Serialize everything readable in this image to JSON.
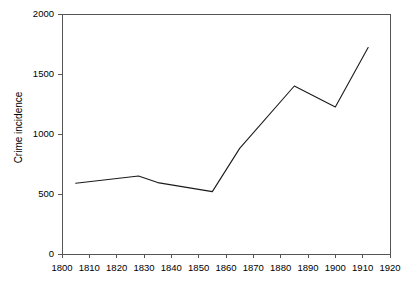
{
  "chart_data": {
    "type": "line",
    "title": "",
    "xlabel": "",
    "ylabel": "Crime incidence",
    "xlim": [
      1800,
      1920
    ],
    "ylim": [
      0,
      2000
    ],
    "xticks": [
      1800,
      1810,
      1820,
      1830,
      1840,
      1850,
      1860,
      1870,
      1880,
      1890,
      1900,
      1910,
      1920
    ],
    "yticks": [
      0,
      500,
      1000,
      1500,
      2000
    ],
    "xtick_labels": [
      "1800",
      "1810",
      "1820",
      "1830",
      "1840",
      "1850",
      "1860",
      "1870",
      "1880",
      "1890",
      "1900",
      "1910",
      "1920"
    ],
    "ytick_labels": [
      "0",
      "500",
      "1000",
      "1500",
      "2000"
    ],
    "grid": false,
    "legend": null,
    "series": [
      {
        "name": "Crime incidence",
        "color": "#1a1a1a",
        "x": [
          1805,
          1828,
          1835,
          1855,
          1865,
          1885,
          1900,
          1912
        ],
        "values": [
          590,
          650,
          595,
          520,
          880,
          1400,
          1225,
          1720
        ]
      }
    ]
  },
  "axes": {
    "y_axis_title": "Crime incidence"
  }
}
